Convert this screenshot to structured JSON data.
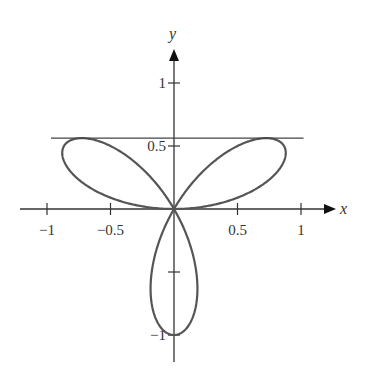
{
  "chart_data": {
    "type": "line",
    "title": "",
    "subtitle": "",
    "equation": "r = sin(3θ)",
    "xlabel": "x",
    "ylabel": "y",
    "xlim": [
      -1.0,
      1.3
    ],
    "ylim": [
      -1.2,
      1.3
    ],
    "grid": false,
    "legend": null,
    "x_ticks": [
      -1,
      -0.5,
      0.5,
      1
    ],
    "x_tick_labels": [
      "−1",
      "−0.5",
      "0.5",
      "1"
    ],
    "y_ticks": [
      1,
      0.5,
      -0.5,
      -1
    ],
    "y_tick_labels": [
      "1",
      "0.5",
      "",
      "−1"
    ],
    "series": [
      {
        "name": "rose curve",
        "kind": "polar",
        "r_of_theta": "sin(3θ)",
        "theta_range": [
          0,
          3.14159
        ],
        "color": "#555555",
        "petals": [
          {
            "direction_deg": 30,
            "tip": [
              0.866,
              0.5
            ]
          },
          {
            "direction_deg": 150,
            "tip": [
              -0.866,
              0.5
            ]
          },
          {
            "direction_deg": 270,
            "tip": [
              0,
              -1
            ]
          }
        ]
      },
      {
        "name": "horizontal tangent line",
        "kind": "hline",
        "y": 0.5625,
        "x_range": [
          -1.0,
          1.02
        ],
        "color": "#444444"
      }
    ],
    "annotations": []
  }
}
